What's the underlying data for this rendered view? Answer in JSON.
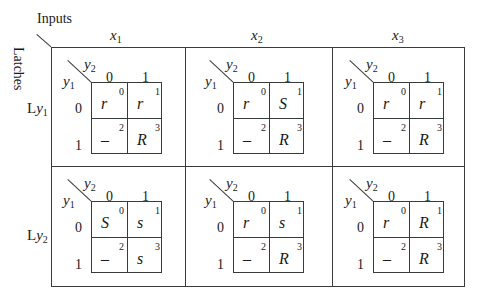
{
  "header": {
    "inputs_label": "Inputs",
    "latches_label": "Latches"
  },
  "columns": [
    {
      "var": "x",
      "sub": "1"
    },
    {
      "var": "x",
      "sub": "2"
    },
    {
      "var": "x",
      "sub": "3"
    }
  ],
  "rows": [
    {
      "prefix": "L",
      "var": "y",
      "sub": "1"
    },
    {
      "prefix": "L",
      "var": "y",
      "sub": "2"
    }
  ],
  "kmap_axes": {
    "row_var": "y",
    "row_sub": "1",
    "col_var": "y",
    "col_sub": "2",
    "col_values": [
      "0",
      "1"
    ],
    "row_values": [
      "0",
      "1"
    ]
  },
  "cell_indices": [
    "0",
    "1",
    "2",
    "3"
  ],
  "kmaps": [
    [
      {
        "cells": [
          "r",
          "r",
          "–",
          "R"
        ]
      },
      {
        "cells": [
          "r",
          "S",
          "–",
          "R"
        ]
      },
      {
        "cells": [
          "r",
          "r",
          "–",
          "R"
        ]
      }
    ],
    [
      {
        "cells": [
          "S",
          "s",
          "–",
          "s"
        ]
      },
      {
        "cells": [
          "r",
          "s",
          "–",
          "R"
        ]
      },
      {
        "cells": [
          "r",
          "R",
          "–",
          "R"
        ]
      }
    ]
  ]
}
